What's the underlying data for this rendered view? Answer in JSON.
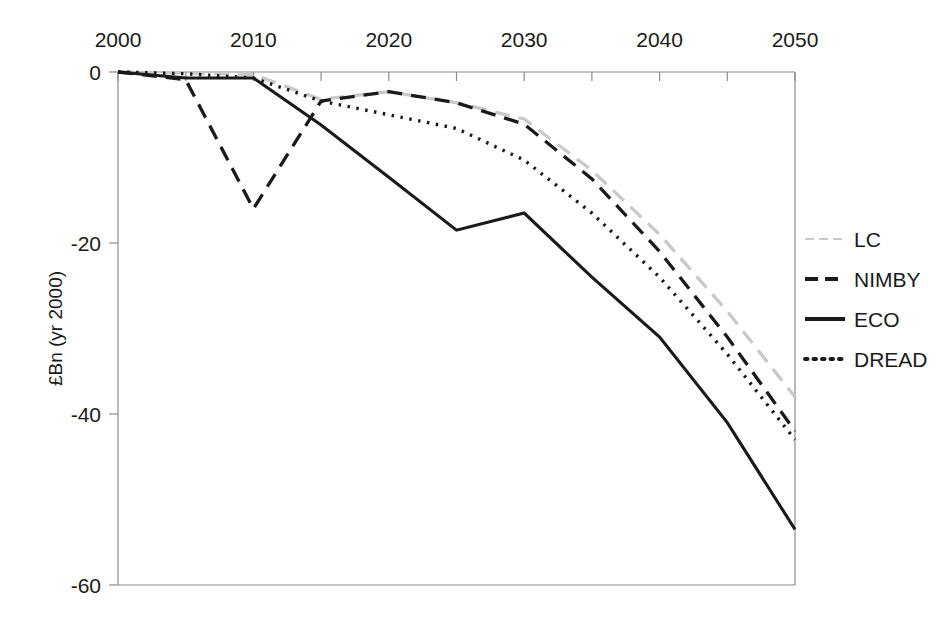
{
  "chart_data": {
    "type": "line",
    "title": "",
    "subtitle": "",
    "xlabel": "",
    "ylabel": "£Bn (yr 2000)",
    "xlim": [
      2000,
      2050
    ],
    "ylim": [
      -60,
      0
    ],
    "xticks": [
      2000,
      2010,
      2020,
      2030,
      2040,
      2050
    ],
    "xtick_labels": [
      "2000",
      "2010",
      "2020",
      "2030",
      "2040",
      "2050"
    ],
    "yticks": [
      0,
      -20,
      -40,
      -60
    ],
    "ytick_labels": [
      "0",
      "-20",
      "-40",
      "-60"
    ],
    "x_axis_position": "top",
    "grid": false,
    "legend_position": "right",
    "x": [
      2000,
      2005,
      2010,
      2015,
      2020,
      2025,
      2030,
      2035,
      2040,
      2045,
      2050
    ],
    "series": [
      {
        "name": "LC",
        "color": "#c9c9c9",
        "style": "dashed",
        "values": [
          0,
          -0.1,
          -0.3,
          -3.2,
          -2.3,
          -3.6,
          -5.5,
          -11.5,
          -19.0,
          -28.0,
          -38.0
        ]
      },
      {
        "name": "NIMBY",
        "color": "#1a1a1a",
        "style": "dashed",
        "values": [
          0,
          -0.9,
          -16.0,
          -3.4,
          -2.3,
          -3.6,
          -6.1,
          -12.5,
          -21.0,
          -31.0,
          -42.0
        ]
      },
      {
        "name": "ECO",
        "color": "#1a1a1a",
        "style": "solid",
        "values": [
          0,
          -0.7,
          -0.7,
          -6.2,
          -12.3,
          -18.5,
          -16.5,
          -24.0,
          -31.0,
          -41.0,
          -53.5
        ]
      },
      {
        "name": "DREAD",
        "color": "#1a1a1a",
        "style": "dotted",
        "values": [
          0,
          -0.2,
          -0.7,
          -3.4,
          -5.0,
          -6.6,
          -10.3,
          -16.5,
          -24.0,
          -33.0,
          -43.0
        ]
      }
    ],
    "annotations": []
  },
  "legend": {
    "items": [
      {
        "label": "LC",
        "swatch": "legend-swatch-lc"
      },
      {
        "label": "NIMBY",
        "swatch": "legend-swatch-nimby"
      },
      {
        "label": "ECO",
        "swatch": "legend-swatch-eco"
      },
      {
        "label": "DREAD",
        "swatch": "legend-swatch-dread"
      }
    ]
  }
}
